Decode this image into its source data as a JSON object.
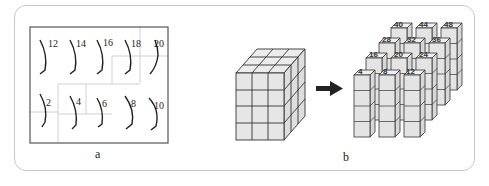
{
  "figure": {
    "panels": [
      {
        "id": "a",
        "label": "a",
        "description": "Grid of 10 curved strokes with even-number labels, faint lighter region grid lines",
        "rows": [
          {
            "labels": [
              "12",
              "14",
              "16",
              "18",
              "20"
            ]
          },
          {
            "labels": [
              "2",
              "4",
              "6",
              "8",
              "10"
            ]
          }
        ]
      },
      {
        "id": "b",
        "label": "b",
        "description": "3x3x4 cube decomposed into 12 columns of 4 stacked cubes",
        "source_cube": {
          "width": 3,
          "depth": 3,
          "height": 4
        },
        "arrow": "right-arrow",
        "tower_rows": [
          {
            "labels": [
              "40",
              "44",
              "48"
            ]
          },
          {
            "labels": [
              "28",
              "32",
              "36"
            ]
          },
          {
            "labels": [
              "16",
              "20",
              "24"
            ]
          },
          {
            "labels": [
              "4",
              "8",
              "12"
            ]
          }
        ]
      }
    ],
    "colors": {
      "frame": "#c8c8c8",
      "cube_face": "#e8e8e8",
      "cube_side": "#dcdcdc",
      "cube_top": "#efefef",
      "edge": "#333333",
      "stroke": "#222222",
      "grid_faint": "#d0d0d0"
    }
  }
}
